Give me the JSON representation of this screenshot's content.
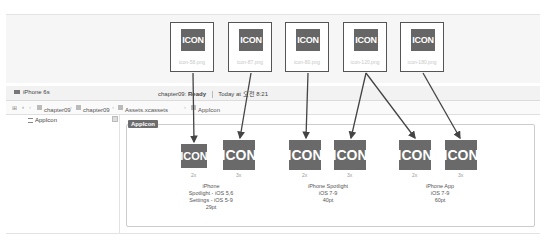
{
  "source_files": [
    {
      "icon_label": "ICON",
      "filename": "icon-58.png"
    },
    {
      "icon_label": "ICON",
      "filename": "icon-87.png"
    },
    {
      "icon_label": "ICON",
      "filename": "icon-80.png"
    },
    {
      "icon_label": "ICON",
      "filename": "icon-120.png"
    },
    {
      "icon_label": "ICON",
      "filename": "icon-180.png"
    }
  ],
  "titlebar": {
    "device": "iPhone 6s",
    "project": "chapter09:",
    "state": "Ready",
    "time": "Today at 오전 8:21"
  },
  "pathbar": {
    "crumbs": [
      "chapter09",
      "chapter09",
      "Assets.xcassets",
      "AppIcon"
    ]
  },
  "sidebar": {
    "items": [
      {
        "label": "AppIcon"
      }
    ]
  },
  "editor": {
    "set_label": "AppIcon",
    "slot_label": "ICON",
    "groups": [
      {
        "scales": [
          "2x",
          "3x"
        ],
        "lines": [
          "iPhone",
          "Spotlight - iOS 5,6",
          "Settings - iOS 5-9",
          "29pt"
        ]
      },
      {
        "scales": [
          "2x",
          "3x"
        ],
        "lines": [
          "iPhone Spotlight",
          "iOS 7-9",
          "40pt"
        ]
      },
      {
        "scales": [
          "2x",
          "3x"
        ],
        "lines": [
          "iPhone App",
          "iOS 7-9",
          "60pt"
        ]
      }
    ]
  }
}
